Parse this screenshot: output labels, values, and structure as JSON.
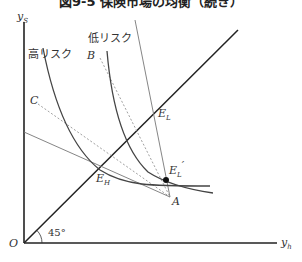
{
  "title": "図9-5 保険市場の均衡（続き）",
  "axes": {
    "y_label": "y",
    "y_sub": "S",
    "x_label": "y",
    "x_sub": "h",
    "origin": "O",
    "angle": "45°"
  },
  "labels": {
    "high_risk": "高リスク",
    "low_risk": "低リスク",
    "B": "B",
    "C": "C",
    "A": "A",
    "E_H": "E",
    "E_H_sub": "H",
    "E_L": "E",
    "E_L_sub": "L",
    "E_L_prime": "E",
    "E_L_prime_sub": "L",
    "prime": "′"
  },
  "colors": {
    "axis": "#222222",
    "curve": "#444444",
    "thin": "#777777",
    "dashed": "#888888"
  }
}
